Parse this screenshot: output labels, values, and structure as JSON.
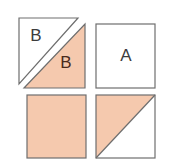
{
  "figure": {
    "title": "",
    "background_color": "#ffffff",
    "fill_color": "#f5c9ae",
    "stroke_color": "#6e6e6e",
    "label_dark_color": "#3c3c3c",
    "label_brown_color": "#4a2a1c",
    "stroke_width": 1.2,
    "cells": [
      {
        "name": "top-left-overlapping-triangles",
        "position": "top-left",
        "shape": "two-offset-right-triangles",
        "labels": [
          {
            "text": "B",
            "fill": "white",
            "color": "#3c3c3c",
            "x": 36,
            "y": 36
          },
          {
            "text": "B",
            "fill": "peach",
            "color": "#4a2a1c",
            "x": 65,
            "y": 63
          }
        ],
        "white_triangle": {
          "points": "19,18 78,18 19,84"
        },
        "peach_triangle": {
          "points": "85,24 85,88 24,88"
        }
      },
      {
        "name": "top-right-square",
        "position": "top-right",
        "shape": "plain-square",
        "fill": "white",
        "rect": {
          "x": 96,
          "y": 24,
          "width": 59,
          "height": 64
        },
        "labels": [
          {
            "text": "A",
            "fill": "white",
            "color": "#3c3c3c",
            "x": 125,
            "y": 56
          }
        ]
      },
      {
        "name": "bottom-left-square",
        "position": "bottom-left",
        "shape": "filled-square",
        "fill": "peach",
        "rect": {
          "x": 27,
          "y": 95,
          "width": 59,
          "height": 63
        },
        "labels": []
      },
      {
        "name": "bottom-right-square",
        "position": "bottom-right",
        "shape": "half-filled-square-diagonal",
        "fill": "half-peach-upper-left",
        "rect": {
          "x": 96,
          "y": 95,
          "width": 59,
          "height": 63
        },
        "peach_triangle": {
          "points": "96,95 155,95 96,158"
        },
        "diagonal": {
          "x1": 96,
          "y1": 158,
          "x2": 155,
          "y2": 95
        },
        "labels": []
      }
    ]
  }
}
